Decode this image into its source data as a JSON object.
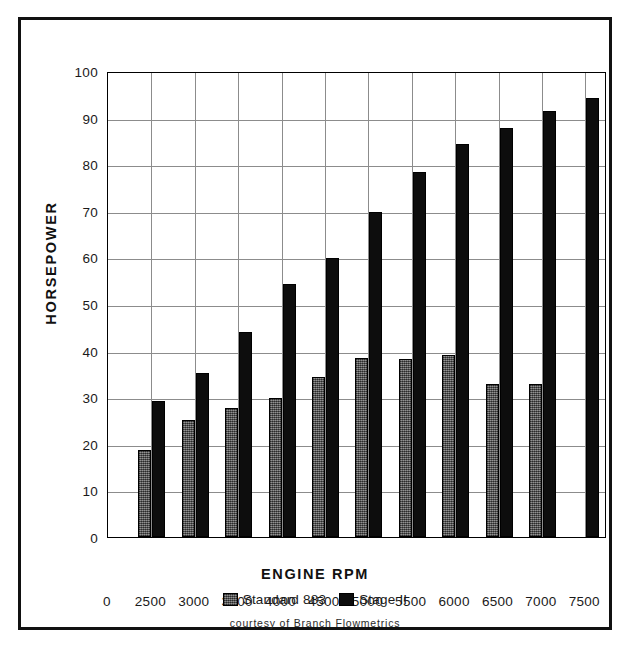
{
  "chart_data": {
    "type": "bar",
    "title": "",
    "xlabel": "ENGINE RPM",
    "ylabel": "HORSEPOWER",
    "ylim": [
      0,
      100
    ],
    "ytick_step": 10,
    "yticks": [
      "0",
      "10",
      "20",
      "30",
      "40",
      "50",
      "60",
      "70",
      "80",
      "90",
      "100"
    ],
    "xticks": [
      "0",
      "2500",
      "3000",
      "3500",
      "4000",
      "4500",
      "5000",
      "5500",
      "6000",
      "6500",
      "7000",
      "7500"
    ],
    "categories": [
      "2500",
      "3000",
      "3500",
      "4000",
      "4500",
      "5000",
      "5500",
      "6000",
      "6500",
      "7000",
      "7500"
    ],
    "grid": true,
    "grid_axis": "both",
    "legend_position": "below-axis",
    "series": [
      {
        "name": "Standard 883",
        "color": "#5c5c5c",
        "values": [
          18.7,
          25.2,
          27.6,
          29.9,
          34.3,
          38.5,
          38.3,
          39.1,
          32.8,
          32.9,
          null
        ]
      },
      {
        "name": "Stage II",
        "color": "#0d0d0d",
        "values": [
          29.2,
          35.1,
          44.0,
          54.2,
          59.8,
          69.7,
          78.4,
          84.3,
          87.8,
          91.4,
          94.2
        ]
      }
    ],
    "annotations": [
      {
        "name": "credit",
        "text": "courtesy of Branch Flowmetrics"
      }
    ]
  },
  "legend": {
    "items": [
      {
        "label": "Standard 883",
        "swatch": "gray-hatched-swatch"
      },
      {
        "label": "Stage II",
        "swatch": "black-swatch"
      }
    ]
  },
  "credit": "courtesy of Branch Flowmetrics"
}
